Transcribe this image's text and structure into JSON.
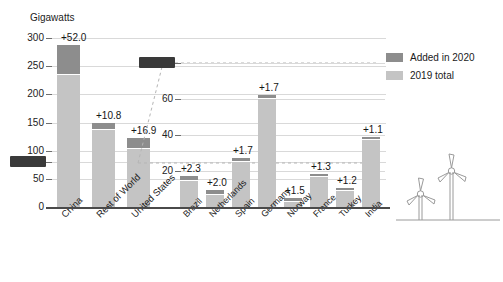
{
  "chart_data": [
    {
      "id": "main",
      "type": "bar",
      "title": "Gigawatts",
      "ylabel": "Gigawatts",
      "xlabel": "",
      "ylim": [
        0,
        300
      ],
      "yticks": [
        0,
        50,
        80,
        100,
        150,
        200,
        250,
        300
      ],
      "ytick_labels": [
        "0",
        "50",
        "80",
        "100",
        "150",
        "200",
        "250",
        "300"
      ],
      "highlighted_tick": "80",
      "grid": true,
      "legend_position": "right",
      "categories": [
        "China",
        "Rest of World",
        "United States"
      ],
      "series": [
        {
          "name": "2019 total",
          "values": [
            236.0,
            138.2,
            105.1
          ],
          "color": "#c4c4c4"
        },
        {
          "name": "Added in 2020",
          "values": [
            52.0,
            10.8,
            16.9
          ],
          "color": "#8d8d8d"
        }
      ],
      "data_labels": [
        "+52.0",
        "+10.8",
        "+16.9"
      ],
      "totals": [
        288.0,
        149.0,
        122.0
      ]
    },
    {
      "id": "inset",
      "type": "bar",
      "title": "",
      "ylabel": "",
      "xlabel": "",
      "ylim": [
        0,
        80
      ],
      "yticks": [
        20,
        40,
        60,
        80
      ],
      "ytick_labels": [
        "20",
        "40",
        "60",
        "80"
      ],
      "highlighted_tick": "80",
      "grid": true,
      "categories": [
        "Brazil",
        "Netherlands",
        "Spain",
        "Germany",
        "Norway",
        "France",
        "Turkey",
        "India"
      ],
      "series": [
        {
          "name": "2019 total",
          "values": [
            14.9,
            7.6,
            25.7,
            60.5,
            3.5,
            17.2,
            9.5,
            37.9
          ],
          "color": "#c4c4c4"
        },
        {
          "name": "Added in 2020",
          "values": [
            2.3,
            2.0,
            1.7,
            1.7,
            1.5,
            1.3,
            1.2,
            1.1
          ],
          "color": "#8d8d8d"
        }
      ],
      "data_labels": [
        "+2.3",
        "+2.0",
        "+1.7",
        "+1.7",
        "+1.5",
        "+1.3",
        "+1.2",
        "+1.1"
      ],
      "totals": [
        17.2,
        9.6,
        27.4,
        62.2,
        5.0,
        18.5,
        10.7,
        39.0
      ]
    }
  ],
  "legend": {
    "items": [
      {
        "label": "Added in 2020",
        "color": "#8d8d8d"
      },
      {
        "label": "2019 total",
        "color": "#c4c4c4"
      }
    ]
  },
  "decoration": {
    "turbine_icon": "wind-turbine-icon",
    "turbine_count": 2
  },
  "colors": {
    "added_2020": "#8d8d8d",
    "total_2019": "#c4c4c4",
    "grid": "#d9d9d9",
    "axis": "#4a4a4a",
    "text": "#1a1a1a",
    "selection": "#3a3a3a"
  }
}
